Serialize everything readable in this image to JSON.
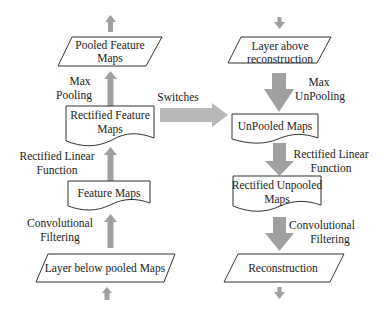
{
  "colors": {
    "arrow": "#a0a0a0",
    "switch_arrow": "#b8b8b8",
    "stroke": "#333333",
    "text": "#1a1a1a",
    "background": "#ffffff"
  },
  "left_column": {
    "title": "Convnet (forward pass)",
    "nodes": [
      {
        "id": "pooled",
        "shape": "parallelogram",
        "line1": "Pooled Feature",
        "line2": "Maps"
      },
      {
        "id": "rectified",
        "shape": "document",
        "line1": "Rectified Feature",
        "line2": "Maps"
      },
      {
        "id": "feature",
        "shape": "document",
        "line1": "Feature Maps"
      },
      {
        "id": "below",
        "shape": "parallelogram",
        "line1": "Layer below pooled Maps"
      }
    ],
    "edges": [
      {
        "from": "rectified",
        "to": "pooled",
        "line1": "Max",
        "line2": "Pooling"
      },
      {
        "from": "feature",
        "to": "rectified",
        "line1": "Rectified Linear",
        "line2": "Function"
      },
      {
        "from": "below",
        "to": "feature",
        "line1": "Convolutional",
        "line2": "Filtering"
      }
    ]
  },
  "right_column": {
    "title": "Deconvnet (reconstruction)",
    "nodes": [
      {
        "id": "above",
        "shape": "parallelogram",
        "line1": "Layer above",
        "line2": "reconstruction"
      },
      {
        "id": "unpooled",
        "shape": "document",
        "line1": "UnPooled Maps"
      },
      {
        "id": "rect_unpooled",
        "shape": "document",
        "line1": "Rectified Unpooled",
        "line2": "Maps"
      },
      {
        "id": "recon",
        "shape": "parallelogram",
        "line1": "Reconstruction"
      }
    ],
    "edges": [
      {
        "from": "above",
        "to": "unpooled",
        "line1": "Max",
        "line2": "UnPooling"
      },
      {
        "from": "unpooled",
        "to": "rect_unpooled",
        "line1": "Rectified Linear",
        "line2": "Function"
      },
      {
        "from": "rect_unpooled",
        "to": "recon",
        "line1": "Convolutional",
        "line2": "Filtering"
      }
    ]
  },
  "switches": {
    "label": "Switches"
  }
}
